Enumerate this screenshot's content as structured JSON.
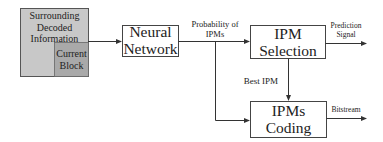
{
  "diagram": {
    "input_block": {
      "outer_label_lines": [
        "Surrounding",
        "Decoded",
        "Information"
      ],
      "inner_label_lines": [
        "Current",
        "Block"
      ],
      "outer_fill": "#c8c8c8",
      "inner_fill": "#a9a9a9"
    },
    "nodes": [
      {
        "id": "neural-network",
        "label_lines": [
          "Neural",
          "Network"
        ]
      },
      {
        "id": "ipm-selection",
        "label_lines": [
          "IPM",
          "Selection"
        ]
      },
      {
        "id": "ipms-coding",
        "label_lines": [
          "IPMs",
          "Coding"
        ]
      }
    ],
    "edge_labels": {
      "probability": [
        "Probability of",
        "IPMs"
      ],
      "prediction": [
        "Prediction",
        "Signal"
      ],
      "best_ipm": "Best IPM",
      "bitstream": "Bitstream"
    },
    "edges": [
      {
        "from": "input-block",
        "to": "neural-network"
      },
      {
        "from": "neural-network",
        "to": "ipm-selection",
        "label": "Probability of IPMs"
      },
      {
        "from": "neural-network",
        "to": "ipms-coding"
      },
      {
        "from": "ipm-selection",
        "to": "ipms-coding",
        "label": "Best IPM"
      },
      {
        "from": "ipm-selection",
        "to": "output",
        "label": "Prediction Signal"
      },
      {
        "from": "ipms-coding",
        "to": "output",
        "label": "Bitstream"
      }
    ],
    "colors": {
      "line": "#333333",
      "box_stroke": "#444444"
    }
  }
}
